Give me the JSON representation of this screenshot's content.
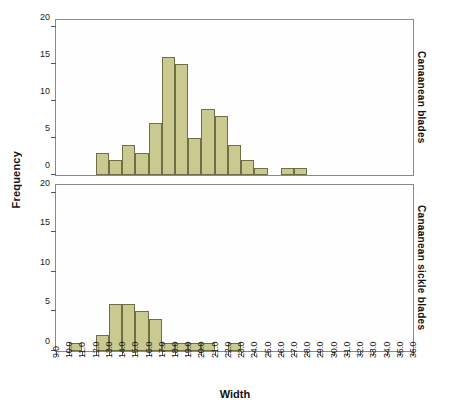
{
  "chart_data": {
    "type": "bar",
    "title": "",
    "xlabel": "Width",
    "ylabel": "Frequency",
    "xlim": [
      9.0,
      36.0
    ],
    "grid": false,
    "legend_position": "right-strip-labels",
    "xticks": [
      "9.0",
      "10.0",
      "11.0",
      "12.0",
      "13.0",
      "14.0",
      "15.0",
      "16.0",
      "17.0",
      "18.0",
      "19.0",
      "20.0",
      "21.0",
      "22.0",
      "23.0",
      "24.0",
      "25.0",
      "26.0",
      "27.0",
      "28.0",
      "29.0",
      "30.0",
      "31.0",
      "32.0",
      "33.0",
      "34.0",
      "35.0",
      "36.0"
    ],
    "yticks": [
      "0",
      "5",
      "10",
      "15",
      "20"
    ],
    "ylim": [
      0,
      21
    ],
    "bin_width": 1.0,
    "panels": [
      {
        "name": "Canaanean blades",
        "bins": [
          {
            "start": 12.0,
            "end": 13.0,
            "count": 3
          },
          {
            "start": 13.0,
            "end": 14.0,
            "count": 2
          },
          {
            "start": 14.0,
            "end": 15.0,
            "count": 4
          },
          {
            "start": 15.0,
            "end": 16.0,
            "count": 3
          },
          {
            "start": 16.0,
            "end": 17.0,
            "count": 7
          },
          {
            "start": 17.0,
            "end": 18.0,
            "count": 16
          },
          {
            "start": 18.0,
            "end": 19.0,
            "count": 15
          },
          {
            "start": 19.0,
            "end": 20.0,
            "count": 5
          },
          {
            "start": 20.0,
            "end": 21.0,
            "count": 9
          },
          {
            "start": 21.0,
            "end": 22.0,
            "count": 8
          },
          {
            "start": 22.0,
            "end": 23.0,
            "count": 4
          },
          {
            "start": 23.0,
            "end": 24.0,
            "count": 2
          },
          {
            "start": 24.0,
            "end": 25.0,
            "count": 1
          },
          {
            "start": 26.0,
            "end": 27.0,
            "count": 1
          },
          {
            "start": 27.0,
            "end": 28.0,
            "count": 1
          }
        ]
      },
      {
        "name": "Canaanean sickle blades",
        "bins": [
          {
            "start": 10.0,
            "end": 11.0,
            "count": 1
          },
          {
            "start": 12.0,
            "end": 13.0,
            "count": 2
          },
          {
            "start": 13.0,
            "end": 14.0,
            "count": 6
          },
          {
            "start": 14.0,
            "end": 15.0,
            "count": 6
          },
          {
            "start": 15.0,
            "end": 16.0,
            "count": 5
          },
          {
            "start": 16.0,
            "end": 17.0,
            "count": 4
          },
          {
            "start": 17.0,
            "end": 18.0,
            "count": 1
          },
          {
            "start": 18.0,
            "end": 19.0,
            "count": 1
          },
          {
            "start": 19.0,
            "end": 20.0,
            "count": 1
          },
          {
            "start": 20.0,
            "end": 21.0,
            "count": 1
          },
          {
            "start": 22.0,
            "end": 23.0,
            "count": 1
          }
        ]
      }
    ],
    "colors": {
      "bar_fill": "#c9c990",
      "bar_border": "#6e6f45",
      "axis": "#555555",
      "panel_border": "#8a8a8a",
      "text": "#111111",
      "background": "#ffffff"
    }
  }
}
